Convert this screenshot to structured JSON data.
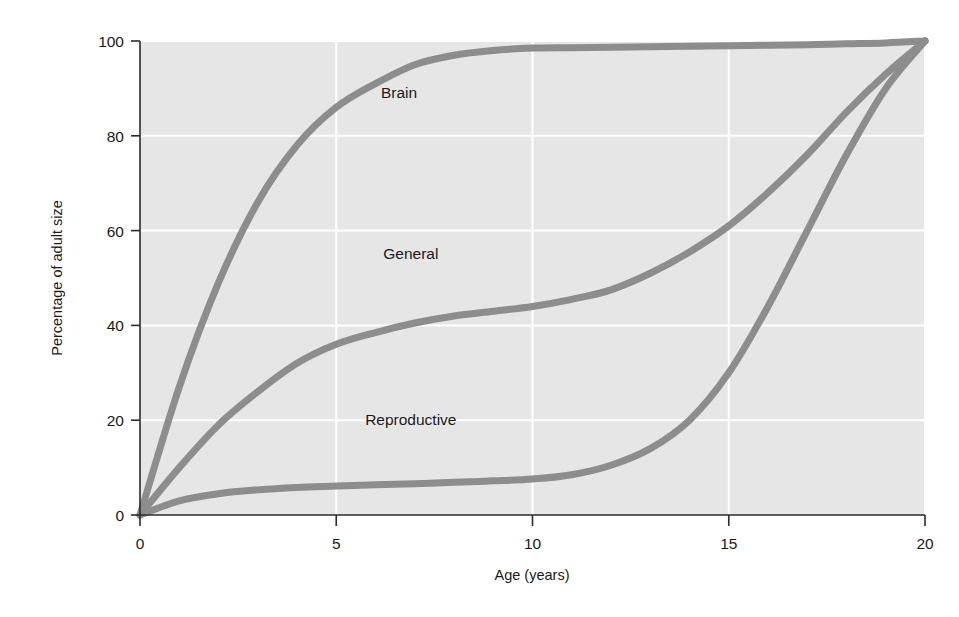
{
  "chart_data": {
    "type": "line",
    "title": "",
    "subtitle": "",
    "xlabel": "Age (years)",
    "ylabel": "Percentage of adult size",
    "xlim": [
      0,
      20
    ],
    "ylim": [
      0,
      100
    ],
    "xticks": [
      "0",
      "5",
      "10",
      "15",
      "20"
    ],
    "yticks": [
      "0",
      "20",
      "40",
      "60",
      "80",
      "100"
    ],
    "xtick_values": [
      0,
      5,
      10,
      15,
      20
    ],
    "ytick_values": [
      0,
      20,
      40,
      60,
      80,
      100
    ],
    "grid": true,
    "grid_color": "#ffffff",
    "plot_background": "#e6e6e6",
    "legend": "inline-annotations",
    "curve_color": "#8d8d8d",
    "curve_width": 7,
    "x": [
      0,
      1,
      2,
      3,
      4,
      5,
      6,
      7,
      8,
      9,
      10,
      11,
      12,
      13,
      14,
      15,
      16,
      17,
      18,
      19,
      20
    ],
    "series": [
      {
        "name": "Brain",
        "label": "Brain",
        "label_x": 6.6,
        "label_y": 88,
        "values": [
          0,
          27,
          49,
          66,
          78,
          86,
          91,
          95,
          97,
          98,
          98.5,
          98.6,
          98.7,
          98.8,
          98.9,
          99,
          99.1,
          99.2,
          99.4,
          99.6,
          100
        ]
      },
      {
        "name": "General",
        "label": "General",
        "label_x": 6.9,
        "label_y": 54,
        "values": [
          0,
          10,
          19,
          26,
          32,
          36,
          38.5,
          40.5,
          42,
          43,
          44,
          45.5,
          47.5,
          51,
          55.5,
          61,
          68,
          76,
          85,
          93,
          100
        ]
      },
      {
        "name": "Reproductive",
        "label": "Reproductive",
        "label_x": 6.9,
        "label_y": 19,
        "values": [
          0,
          3,
          4.5,
          5.3,
          5.8,
          6.1,
          6.4,
          6.6,
          6.9,
          7.2,
          7.6,
          8.5,
          10.5,
          14,
          20,
          30,
          44,
          60,
          76,
          90,
          100
        ]
      }
    ]
  }
}
